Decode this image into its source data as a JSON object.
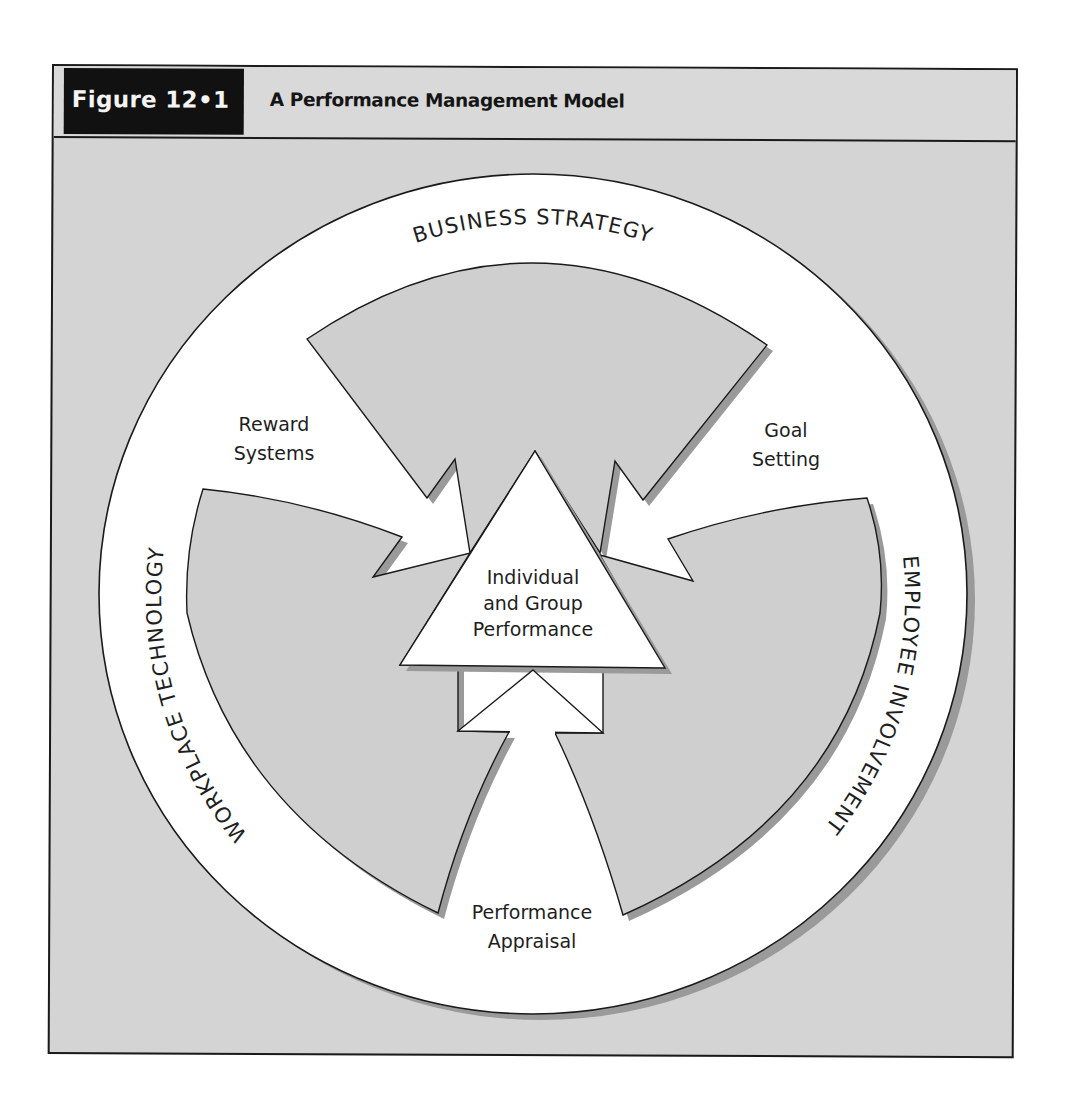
{
  "figure": {
    "number_label": "Figure 12•1",
    "title": "A Performance Management Model"
  },
  "diagram": {
    "outer_ring_labels": {
      "top": "BUSINESS  STRATEGY",
      "right": "EMPLOYEE  INVOLVEMENT",
      "left": "WORKPLACE  TECHNOLOGY"
    },
    "arrow_labels": {
      "upper_left": [
        "Reward",
        "Systems"
      ],
      "upper_right": [
        "Goal",
        "Setting"
      ],
      "bottom": [
        "Performance",
        "Appraisal"
      ]
    },
    "center": [
      "Individual",
      "and Group",
      "Performance"
    ],
    "colors": {
      "background": "#d4d4d4",
      "ring": "#ffffff",
      "lobe": "#cfcfcf",
      "shadow": "#9a9a9a",
      "outline": "#1a1a1a",
      "label_box": "#111111"
    }
  }
}
